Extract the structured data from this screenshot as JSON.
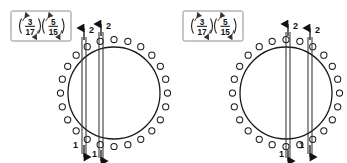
{
  "page": {
    "width": 347,
    "height": 163,
    "background": "#ffffff",
    "ink_color": "#1a1a1a",
    "box_border_color": "#8a8a8a"
  },
  "panels": [
    {
      "id": "left-panel",
      "cycle_box": {
        "label": "cycle-notation-box",
        "groups": [
          {
            "top": "3",
            "bottom": "17",
            "arrow_in": "↗",
            "arrow_out": "↙"
          },
          {
            "top": "5",
            "bottom": "15",
            "arrow_in": "↗",
            "arrow_out": "↙"
          }
        ],
        "text": "(3/17)(5/15)"
      },
      "circle": {
        "label": "dot-circle",
        "dot_count": 24,
        "radius": 46,
        "center_x": 114,
        "center_y": 93,
        "dot_radius": 3.1
      },
      "chords": [
        {
          "name": "chord-a",
          "x_top": 84,
          "x_bottom": 84,
          "width": 4
        },
        {
          "name": "chord-b",
          "x_top": 101,
          "x_bottom": 101,
          "width": 4
        }
      ],
      "arrow_labels_top": [
        {
          "value": "2",
          "x": 84
        },
        {
          "value": "2",
          "x": 101
        }
      ],
      "arrow_labels_bottom": [
        {
          "value": "1",
          "x": 84
        },
        {
          "value": "1",
          "x": 101
        }
      ]
    },
    {
      "id": "right-panel",
      "cycle_box": {
        "label": "cycle-notation-box",
        "groups": [
          {
            "top": "3",
            "bottom": "17",
            "arrow_in": "↗",
            "arrow_out": "↙"
          },
          {
            "top": "5",
            "bottom": "15",
            "arrow_in": "↗",
            "arrow_out": "↙"
          }
        ],
        "text": "(3/17)(5/15)"
      },
      "circle": {
        "label": "dot-circle",
        "dot_count": 24,
        "radius": 46,
        "center_x": 286,
        "center_y": 93,
        "dot_radius": 3.1
      },
      "chords": [
        {
          "name": "chord-a",
          "x_top": 288,
          "x_bottom": 288,
          "width": 4
        },
        {
          "name": "chord-b",
          "x_top": 310,
          "x_bottom": 310,
          "width": 4
        }
      ],
      "arrow_labels_top": [
        {
          "value": "2",
          "x": 288
        },
        {
          "value": "2",
          "x": 310
        }
      ],
      "arrow_labels_bottom": [
        {
          "value": "1",
          "x": 288
        },
        {
          "value": "1",
          "x": 310
        }
      ]
    }
  ],
  "glyphs": {
    "arrow_up": "▲",
    "arrow_down": "▼",
    "paren_open": "(",
    "paren_close": ")"
  }
}
